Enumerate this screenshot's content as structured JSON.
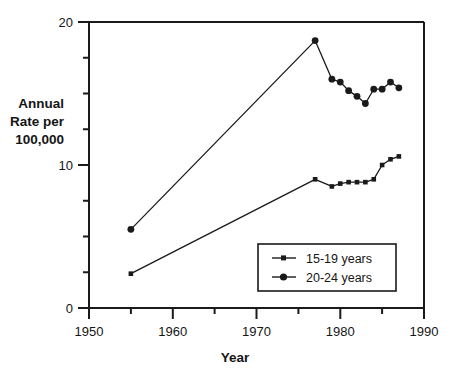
{
  "chart_data": {
    "type": "line",
    "title": "",
    "subtitle": "",
    "xlabel": "Year",
    "ylabel": "Annual Rate per 100,000",
    "ylabel_lines": [
      "Annual",
      "Rate per",
      "100,000"
    ],
    "xlim": [
      1950,
      1990
    ],
    "ylim": [
      0,
      20
    ],
    "xticks": [
      1950,
      1955,
      1960,
      1965,
      1970,
      1975,
      1980,
      1985,
      1990
    ],
    "xtick_labels": [
      "1950",
      "",
      "1960",
      "",
      "1970",
      "",
      "1980",
      "",
      "1990"
    ],
    "yticks": [
      0,
      2.5,
      5,
      7.5,
      10,
      12.5,
      15,
      17.5,
      20
    ],
    "ytick_labels": [
      "0",
      "",
      "",
      "",
      "10",
      "",
      "",
      "",
      "20"
    ],
    "grid": false,
    "legend_position": "lower right",
    "series": [
      {
        "name": "15-19 years",
        "marker": "small-square",
        "color": "#1a1a1a",
        "x": [
          1955,
          1977,
          1979,
          1980,
          1981,
          1982,
          1983,
          1984,
          1985,
          1986,
          1987
        ],
        "values": [
          2.4,
          9.0,
          8.5,
          8.7,
          8.8,
          8.8,
          8.8,
          9.0,
          10.0,
          10.4,
          10.6
        ]
      },
      {
        "name": "20-24 years",
        "marker": "large-circle",
        "color": "#1a1a1a",
        "x": [
          1955,
          1977,
          1979,
          1980,
          1981,
          1982,
          1983,
          1984,
          1985,
          1986,
          1987
        ],
        "values": [
          5.5,
          18.7,
          16.0,
          15.8,
          15.2,
          14.8,
          14.3,
          15.3,
          15.3,
          15.8,
          15.4
        ]
      }
    ]
  },
  "legend": {
    "entries": [
      {
        "label": "15-19 years"
      },
      {
        "label": "20-24 years"
      }
    ]
  },
  "axes": {
    "y_label_line1": "Annual",
    "y_label_line2": "Rate per",
    "y_label_line3": "100,000",
    "x_label": "Year",
    "y_tick_top": "20",
    "y_tick_mid": "10",
    "y_tick_bottom": "0",
    "x_tick_1950": "1950",
    "x_tick_1960": "1960",
    "x_tick_1970": "1970",
    "x_tick_1980": "1980",
    "x_tick_1990": "1990"
  },
  "colors": {
    "ink": "#1a1a1a",
    "background": "#ffffff"
  }
}
